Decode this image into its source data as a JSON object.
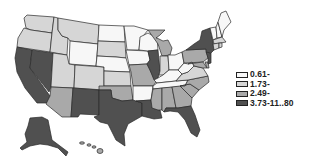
{
  "map": {
    "type": "choropleth",
    "region": "United States",
    "classes": [
      {
        "id": "c1",
        "label": "0.61-",
        "color": "#f7f7f7"
      },
      {
        "id": "c2",
        "label": "1.73-",
        "color": "#d6d6d6"
      },
      {
        "id": "c3",
        "label": "2.49-",
        "color": "#a9a9a9"
      },
      {
        "id": "c4",
        "label": "3.73-11..80",
        "color": "#505050"
      }
    ],
    "states": {
      "WA": "c2",
      "OR": "c2",
      "CA": "c4",
      "NV": "c4",
      "ID": "c2",
      "MT": "c2",
      "WY": "c1",
      "UT": "c2",
      "AZ": "c3",
      "CO": "c2",
      "NM": "c4",
      "ND": "c1",
      "SD": "c2",
      "NE": "c1",
      "KS": "c2",
      "OK": "c3",
      "TX": "c4",
      "MN": "c1",
      "IA": "c1",
      "MO": "c3",
      "AR": "c1",
      "LA": "c4",
      "WI": "c1",
      "IL": "c4",
      "MI": "c3",
      "IN": "c2",
      "OH": "c1",
      "KY": "c1",
      "TN": "c1",
      "MS": "c3",
      "AL": "c3",
      "GA": "c3",
      "FL": "c4",
      "SC": "c3",
      "NC": "c3",
      "VA": "c2",
      "WV": "c1",
      "PA": "c3",
      "NY": "c4",
      "VT": "c1",
      "NH": "c1",
      "ME": "c1",
      "MA": "c2",
      "CT": "c2",
      "RI": "c2",
      "NJ": "c4",
      "DE": "c3",
      "MD": "c3",
      "AK": "c4",
      "HI": "c3"
    }
  },
  "legend": {
    "items": [
      "0.61-",
      "1.73-",
      "2.49-",
      "3.73-11..80"
    ]
  }
}
